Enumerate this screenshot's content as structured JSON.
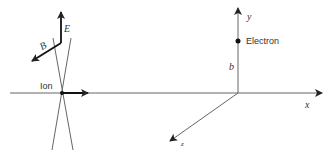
{
  "labels": {
    "ion": "Ion",
    "electron": "Electron",
    "b": "b",
    "x": "x",
    "y": "y",
    "z": "z",
    "E": "E",
    "B": "B"
  },
  "colors": {
    "line": "#555555",
    "bold": "#111111",
    "text": "#333333"
  }
}
